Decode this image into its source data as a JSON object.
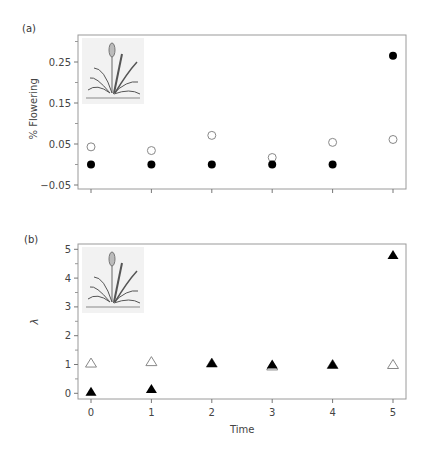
{
  "chart_data": [
    {
      "panel": "(a)",
      "type": "scatter",
      "title": "",
      "xlabel": "",
      "ylabel": "% Flowering",
      "x": [
        0,
        1,
        2,
        3,
        4,
        5
      ],
      "yticks": [
        "0.25",
        "0.15",
        "0.05",
        "−0.05"
      ],
      "ylim": [
        -0.06,
        0.31
      ],
      "grid": false,
      "legend": null,
      "series": [
        {
          "name": "open circles",
          "marker": "circle-open",
          "values": [
            0.043,
            0.034,
            0.071,
            0.017,
            0.054,
            0.061
          ]
        },
        {
          "name": "filled circles",
          "marker": "circle-filled",
          "values": [
            0.0,
            0.0,
            0.0,
            0.0,
            0.0,
            0.265
          ]
        }
      ],
      "annotations": [
        "plant illustration (top-left inset)"
      ]
    },
    {
      "panel": "(b)",
      "type": "scatter",
      "title": "",
      "xlabel": "Time",
      "ylabel": "λ",
      "x": [
        0,
        1,
        2,
        3,
        4,
        5
      ],
      "xticks": [
        "0",
        "1",
        "2",
        "3",
        "4",
        "5"
      ],
      "yticks": [
        "5",
        "4",
        "3",
        "2",
        "1",
        "0"
      ],
      "ylim": [
        -0.2,
        5.2
      ],
      "grid": false,
      "legend": null,
      "series": [
        {
          "name": "open triangles",
          "marker": "triangle-open",
          "values": [
            1.05,
            1.1,
            1.05,
            0.95,
            1.0,
            1.0
          ]
        },
        {
          "name": "filled triangles",
          "marker": "triangle-filled",
          "values": [
            0.05,
            0.15,
            1.05,
            1.0,
            1.0,
            4.8
          ]
        }
      ],
      "annotations": [
        "plant illustration (top-left inset)"
      ]
    }
  ],
  "labels": {
    "panel_a": "(a)",
    "panel_b": "(b)",
    "ylabel_a": "% Flowering",
    "ylabel_b": "λ",
    "xlabel_b": "Time"
  }
}
